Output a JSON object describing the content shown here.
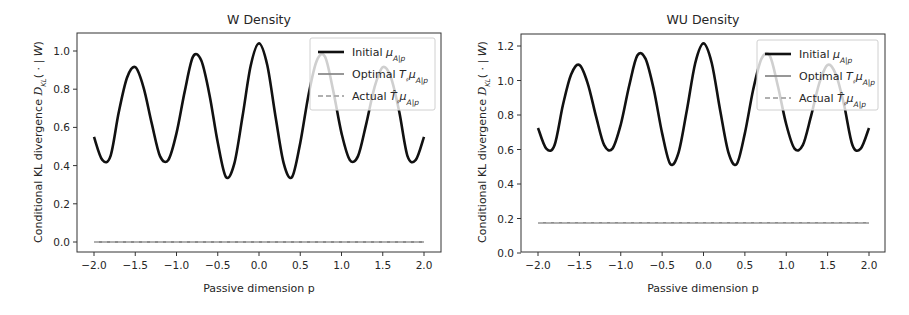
{
  "figure": {
    "panels": [
      {
        "title": "W Density",
        "xlabel": "Passive dimension p",
        "ylabel": "Conditional KL divergence D_KL( · | W)",
        "legend": [
          {
            "label": "Initial μ_A|p",
            "style": "solid",
            "color": "#111111"
          },
          {
            "label": "Optimal T_#μ_A|p",
            "style": "solid",
            "color": "#8c8c8c"
          },
          {
            "label": "Actual T̂_#μ_A|p",
            "style": "dashed",
            "color": "#b0b0b0"
          }
        ]
      },
      {
        "title": "WU Density",
        "xlabel": "Passive dimension p",
        "ylabel": "Conditional KL divergence D_KL( · | W)",
        "legend": [
          {
            "label": "Initial μ_A|p",
            "style": "solid",
            "color": "#111111"
          },
          {
            "label": "Optimal T_#μ_A|p",
            "style": "solid",
            "color": "#8c8c8c"
          },
          {
            "label": "Actual T̂_#μ_A|p",
            "style": "dashed",
            "color": "#b0b0b0"
          }
        ]
      }
    ]
  },
  "chart_data": [
    {
      "type": "line",
      "title": "W Density",
      "xlabel": "Passive dimension p",
      "ylabel": "Conditional KL divergence D_KL( · | W)",
      "xlim": [
        -2.2,
        2.2
      ],
      "ylim": [
        -0.05,
        1.09
      ],
      "xticks": [
        -2.0,
        -1.5,
        -1.0,
        -0.5,
        0.0,
        0.5,
        1.0,
        1.5,
        2.0
      ],
      "xtick_labels": [
        "−2.0",
        "−1.5",
        "−1.0",
        "−0.5",
        "0.0",
        "0.5",
        "1.0",
        "1.5",
        "2.0"
      ],
      "yticks": [
        0.0,
        0.2,
        0.4,
        0.6,
        0.8,
        1.0
      ],
      "ytick_labels": [
        "0.0",
        "0.2",
        "0.4",
        "0.6",
        "0.8",
        "1.0"
      ],
      "grid": false,
      "legend_position": "upper right",
      "x": [
        -2.0,
        -1.9,
        -1.8,
        -1.7,
        -1.6,
        -1.5,
        -1.4,
        -1.3,
        -1.2,
        -1.1,
        -1.0,
        -0.9,
        -0.8,
        -0.7,
        -0.6,
        -0.5,
        -0.4,
        -0.3,
        -0.2,
        -0.1,
        0.0,
        0.1,
        0.2,
        0.3,
        0.4,
        0.5,
        0.6,
        0.7,
        0.8,
        0.9,
        1.0,
        1.1,
        1.2,
        1.3,
        1.4,
        1.5,
        1.6,
        1.7,
        1.8,
        1.9,
        2.0
      ],
      "series": [
        {
          "name": "Initial μ_A|p",
          "color": "#111111",
          "style": "solid",
          "values": [
            0.55,
            0.43,
            0.45,
            0.68,
            0.86,
            0.915,
            0.81,
            0.62,
            0.45,
            0.43,
            0.57,
            0.79,
            0.97,
            0.95,
            0.77,
            0.52,
            0.34,
            0.41,
            0.657,
            0.925,
            1.04,
            0.925,
            0.657,
            0.41,
            0.34,
            0.52,
            0.77,
            0.95,
            0.97,
            0.79,
            0.57,
            0.43,
            0.45,
            0.62,
            0.81,
            0.915,
            0.86,
            0.68,
            0.45,
            0.43,
            0.55
          ]
        },
        {
          "name": "Optimal T_#μ_A|p",
          "color": "#8c8c8c",
          "style": "solid",
          "values": [
            0.0,
            0.0,
            0.0,
            0.0,
            0.0,
            0.0,
            0.0,
            0.0,
            0.0,
            0.0,
            0.0,
            0.0,
            0.0,
            0.0,
            0.0,
            0.0,
            0.0,
            0.0,
            0.0,
            0.0,
            0.0,
            0.0,
            0.0,
            0.0,
            0.0,
            0.0,
            0.0,
            0.0,
            0.0,
            0.0,
            0.0,
            0.0,
            0.0,
            0.0,
            0.0,
            0.0,
            0.0,
            0.0,
            0.0,
            0.0,
            0.0
          ]
        },
        {
          "name": "Actual T̂_#μ_A|p",
          "color": "#b0b0b0",
          "style": "dashed",
          "values": [
            0.0,
            0.0,
            0.0,
            0.0,
            0.0,
            0.0,
            0.0,
            0.0,
            0.0,
            0.0,
            0.0,
            0.0,
            0.0,
            0.0,
            0.0,
            0.0,
            0.0,
            0.0,
            0.0,
            0.0,
            0.0,
            0.0,
            0.0,
            0.0,
            0.0,
            0.0,
            0.0,
            0.0,
            0.0,
            0.0,
            0.0,
            0.0,
            0.0,
            0.0,
            0.0,
            0.0,
            0.0,
            0.0,
            0.0,
            0.0,
            0.0
          ]
        }
      ]
    },
    {
      "type": "line",
      "title": "WU Density",
      "xlabel": "Passive dimension p",
      "ylabel": "Conditional KL divergence D_KL( · | W)",
      "xlim": [
        -2.2,
        2.2
      ],
      "ylim": [
        0.0,
        1.27
      ],
      "xticks": [
        -2.0,
        -1.5,
        -1.0,
        -0.5,
        0.0,
        0.5,
        1.0,
        1.5,
        2.0
      ],
      "xtick_labels": [
        "−2.0",
        "−1.5",
        "−1.0",
        "−0.5",
        "0.0",
        "0.5",
        "1.0",
        "1.5",
        "2.0"
      ],
      "yticks": [
        0.0,
        0.2,
        0.4,
        0.6,
        0.8,
        1.0,
        1.2
      ],
      "ytick_labels": [
        "0.0",
        "0.2",
        "0.4",
        "0.6",
        "0.8",
        "1.0",
        "1.2"
      ],
      "grid": false,
      "legend_position": "upper right",
      "x": [
        -2.0,
        -1.9,
        -1.8,
        -1.7,
        -1.6,
        -1.5,
        -1.4,
        -1.3,
        -1.2,
        -1.1,
        -1.0,
        -0.9,
        -0.8,
        -0.7,
        -0.6,
        -0.5,
        -0.4,
        -0.3,
        -0.2,
        -0.1,
        0.0,
        0.1,
        0.2,
        0.3,
        0.4,
        0.5,
        0.6,
        0.7,
        0.8,
        0.9,
        1.0,
        1.1,
        1.2,
        1.3,
        1.4,
        1.5,
        1.6,
        1.7,
        1.8,
        1.9,
        2.0
      ],
      "series": [
        {
          "name": "Initial μ_A|p",
          "color": "#111111",
          "style": "solid",
          "values": [
            0.725,
            0.605,
            0.625,
            0.855,
            1.035,
            1.09,
            0.985,
            0.795,
            0.625,
            0.605,
            0.745,
            0.965,
            1.145,
            1.125,
            0.945,
            0.695,
            0.515,
            0.585,
            0.832,
            1.1,
            1.215,
            1.1,
            0.832,
            0.585,
            0.515,
            0.695,
            0.945,
            1.125,
            1.145,
            0.965,
            0.745,
            0.605,
            0.625,
            0.795,
            0.985,
            1.09,
            1.035,
            0.855,
            0.625,
            0.605,
            0.725
          ]
        },
        {
          "name": "Optimal T_#μ_A|p",
          "color": "#8c8c8c",
          "style": "solid",
          "values": [
            0.175,
            0.175,
            0.175,
            0.175,
            0.175,
            0.175,
            0.175,
            0.175,
            0.175,
            0.175,
            0.175,
            0.175,
            0.175,
            0.175,
            0.175,
            0.175,
            0.175,
            0.175,
            0.175,
            0.175,
            0.175,
            0.175,
            0.175,
            0.175,
            0.175,
            0.175,
            0.175,
            0.175,
            0.175,
            0.175,
            0.175,
            0.175,
            0.175,
            0.175,
            0.175,
            0.175,
            0.175,
            0.175,
            0.175,
            0.175,
            0.175
          ]
        },
        {
          "name": "Actual T̂_#μ_A|p",
          "color": "#b0b0b0",
          "style": "dashed",
          "values": [
            0.175,
            0.175,
            0.175,
            0.175,
            0.175,
            0.175,
            0.175,
            0.175,
            0.175,
            0.175,
            0.175,
            0.175,
            0.175,
            0.175,
            0.175,
            0.175,
            0.175,
            0.175,
            0.175,
            0.175,
            0.175,
            0.175,
            0.175,
            0.175,
            0.175,
            0.175,
            0.175,
            0.175,
            0.175,
            0.175,
            0.175,
            0.175,
            0.175,
            0.175,
            0.175,
            0.175,
            0.175,
            0.175,
            0.175,
            0.175,
            0.175
          ]
        }
      ]
    }
  ]
}
